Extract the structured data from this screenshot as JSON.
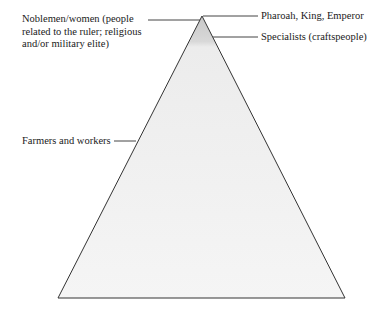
{
  "diagram": {
    "type": "social-pyramid",
    "levels": [
      {
        "id": "top",
        "label": "Pharoah, King, Emperor"
      },
      {
        "id": "nobles",
        "label_lines": [
          "Noblemen/women (people",
          "related to the ruler; religious",
          "and/or military elite)"
        ]
      },
      {
        "id": "specialists",
        "label": "Specialists (craftspeople)"
      },
      {
        "id": "farmers",
        "label": "Farmers and workers"
      }
    ],
    "colors": {
      "outline": "#333333",
      "fill_top": "#cfcfcf",
      "fill_base": "#f4f4f4"
    }
  }
}
